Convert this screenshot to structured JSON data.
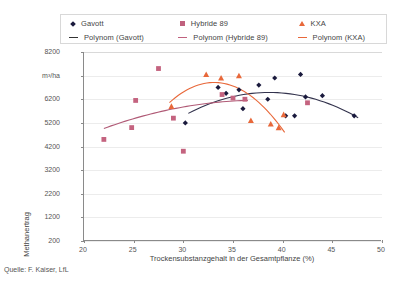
{
  "source_note": "Quelle: F. Kaiser, LfL",
  "legend": {
    "items": [
      {
        "label": "Gavott",
        "marker": "diamond-marker",
        "color": "#1a1a3d"
      },
      {
        "label": "Hybride 89",
        "marker": "square-marker",
        "color": "#c0617e"
      },
      {
        "label": "KXA",
        "marker": "triangle-marker",
        "color": "#e8683a"
      },
      {
        "label": "Polynom (Gavott)",
        "marker": "line-marker",
        "color": "#333333"
      },
      {
        "label": "Polynom (Hybride 89)",
        "marker": "line-marker",
        "color": "#c0617e"
      },
      {
        "label": "Polynom (KXA)",
        "marker": "line-marker",
        "color": "#e8683a"
      }
    ]
  },
  "chart_data": {
    "type": "scatter",
    "title": "",
    "xlabel": "Trockensubstanzgehalt in der Gesamtpflanze (%)",
    "ylabel": "Methanertrag",
    "yunit": "m³/ha",
    "xlim": [
      20,
      50
    ],
    "ylim": [
      200,
      8200
    ],
    "xticks": [
      20,
      25,
      30,
      35,
      40,
      45,
      50
    ],
    "yticks": [
      200,
      1200,
      2200,
      3200,
      4200,
      5200,
      6200,
      7200,
      8200
    ],
    "ytick_labels": [
      "200",
      "1200",
      "2200",
      "3200",
      "4200",
      "5200",
      "6200",
      "m³/ha",
      "8200"
    ],
    "grid": true,
    "legend_position": "top",
    "series": [
      {
        "name": "Gavott",
        "marker": "diamond",
        "color": "#1a1a3d",
        "points": [
          [
            30.2,
            5200
          ],
          [
            33.5,
            6700
          ],
          [
            34.3,
            6450
          ],
          [
            35.6,
            6600
          ],
          [
            36.0,
            5800
          ],
          [
            37.6,
            6800
          ],
          [
            38.5,
            6200
          ],
          [
            39.2,
            7100
          ],
          [
            40.3,
            5500
          ],
          [
            41.2,
            5500
          ],
          [
            41.8,
            7250
          ],
          [
            42.3,
            6300
          ],
          [
            44.0,
            6350
          ],
          [
            47.2,
            5500
          ]
        ]
      },
      {
        "name": "Hybride 89",
        "marker": "square",
        "color": "#c4637f",
        "points": [
          [
            22.0,
            4500
          ],
          [
            24.8,
            5000
          ],
          [
            25.2,
            6150
          ],
          [
            27.5,
            7500
          ],
          [
            29.0,
            5400
          ],
          [
            30.0,
            4000
          ],
          [
            33.9,
            6400
          ],
          [
            35.0,
            6250
          ],
          [
            36.2,
            6200
          ],
          [
            42.5,
            6050
          ]
        ]
      },
      {
        "name": "KXA",
        "marker": "triangle",
        "color": "#e8683a",
        "points": [
          [
            28.8,
            5900
          ],
          [
            32.3,
            7250
          ],
          [
            33.8,
            7100
          ],
          [
            35.6,
            7200
          ],
          [
            36.8,
            5300
          ],
          [
            38.8,
            5150
          ],
          [
            39.6,
            5000
          ],
          [
            40.1,
            5550
          ]
        ]
      }
    ],
    "trendlines": [
      {
        "name": "Polynom (Gavott)",
        "color": "#33334d",
        "xrange": [
          30.5,
          47.6
        ],
        "coefficients_note": "quadratic fit, peak ~6700 near x=38"
      },
      {
        "name": "Polynom (Hybride 89)",
        "color": "#b05a76",
        "xrange": [
          22.0,
          36.5
        ],
        "coefficients_note": "quadratic fit, plateau ~6200 near x=34"
      },
      {
        "name": "Polynom (KXA)",
        "color": "#e8683a",
        "xrange": [
          28.6,
          40.2
        ],
        "coefficients_note": "quadratic fit, peak ~6350 near x=33, falling to ~5400"
      }
    ]
  }
}
